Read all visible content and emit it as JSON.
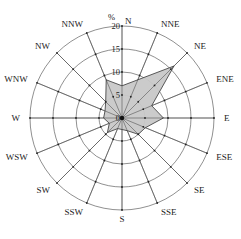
{
  "chart_data": {
    "type": "radar",
    "subtype": "wind-rose",
    "title": "",
    "unit_label": "%",
    "directions": [
      "N",
      "NNE",
      "NE",
      "ENE",
      "E",
      "ESE",
      "SE",
      "SSE",
      "S",
      "SSW",
      "SW",
      "WSW",
      "W",
      "WNW",
      "NW",
      "NNW"
    ],
    "values": [
      7,
      9,
      16,
      7,
      9,
      5.5,
      5,
      3,
      2.5,
      2.5,
      4.5,
      3,
      4,
      4,
      5,
      9
    ],
    "radial_ticks": [
      0,
      5,
      10,
      15,
      20
    ],
    "radial_tick_labels": [
      "0",
      "5",
      "10",
      "15",
      "20"
    ],
    "rlim": [
      0,
      20
    ],
    "grid": true,
    "fill_color": "#c8c8c8",
    "line_color": "#333333"
  }
}
